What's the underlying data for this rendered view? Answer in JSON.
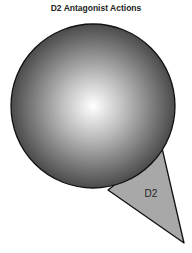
{
  "title": "D2 Antagonist Actions",
  "diagram": {
    "sphere": {
      "label": "",
      "gradient_center": "#ffffff",
      "gradient_edge": "#3a3a3a"
    },
    "receptor_wedge": {
      "label": "D2",
      "fill": "#a8a8a8"
    }
  }
}
